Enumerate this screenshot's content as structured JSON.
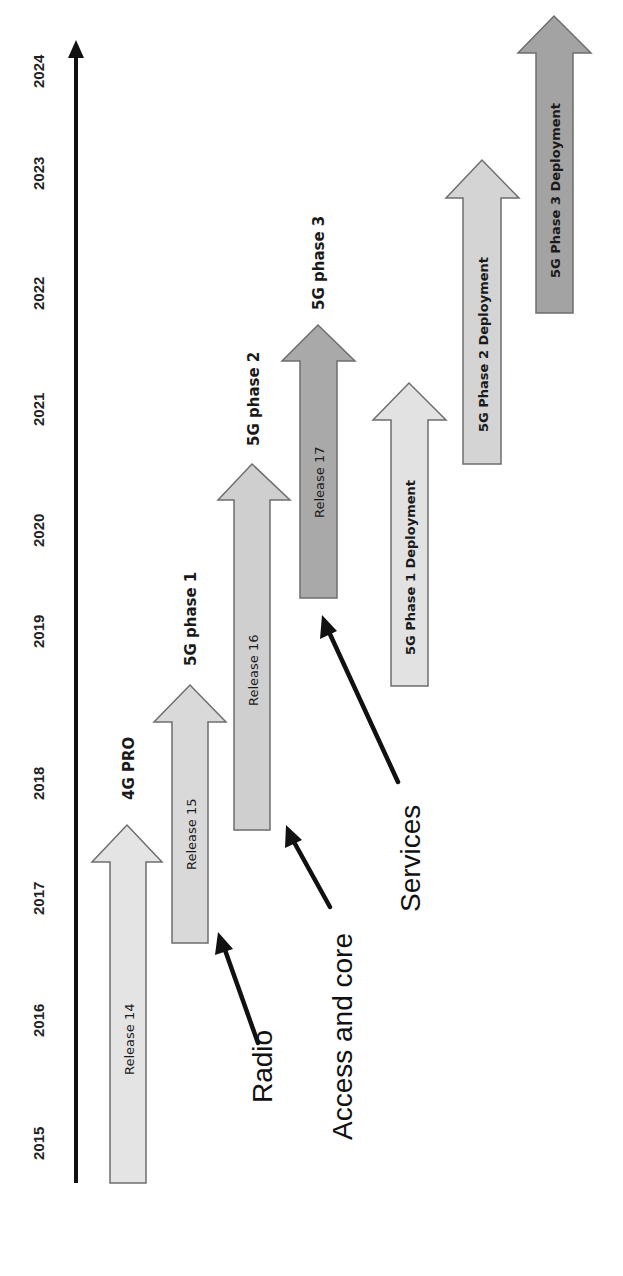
{
  "axis": {
    "years": [
      "2015",
      "2016",
      "2017",
      "2018",
      "2019",
      "2020",
      "2021",
      "2022",
      "2023",
      "2024"
    ],
    "color": "#111111"
  },
  "releases": [
    {
      "label": "Release 14",
      "phase": "4G PRO",
      "fill": "#e4e4e4",
      "start_year": 2015.0,
      "end_year": 2017.4
    },
    {
      "label": "Release 15",
      "phase": "5G phase 1",
      "fill": "#d9d9d9",
      "start_year": 2016.5,
      "end_year": 2018.6
    },
    {
      "label": "Release 16",
      "phase": "5G phase 2",
      "fill": "#cfcfcf",
      "start_year": 2017.4,
      "end_year": 2020.5
    },
    {
      "label": "Release 17",
      "phase": "5G phase 3",
      "fill": "#a9a9a9",
      "start_year": 2019.3,
      "end_year": 2021.7
    }
  ],
  "deployments": [
    {
      "label": "5G Phase 1 Deployment",
      "fill": "#e2e2e2",
      "start_year": 2018.6,
      "end_year": 2021.2
    },
    {
      "label": "5G Phase 2 Deployment",
      "fill": "#d4d4d4",
      "start_year": 2020.5,
      "end_year": 2023.0
    },
    {
      "label": "5G Phase 3 Deployment",
      "fill": "#a3a3a3",
      "start_year": 2021.9,
      "end_year": 2024.4
    }
  ],
  "callouts": [
    {
      "label": "Radio",
      "points_to": "Release 15"
    },
    {
      "label": "Access and core",
      "points_to": "Release 16"
    },
    {
      "label": "Services",
      "points_to": "Release 17"
    }
  ]
}
